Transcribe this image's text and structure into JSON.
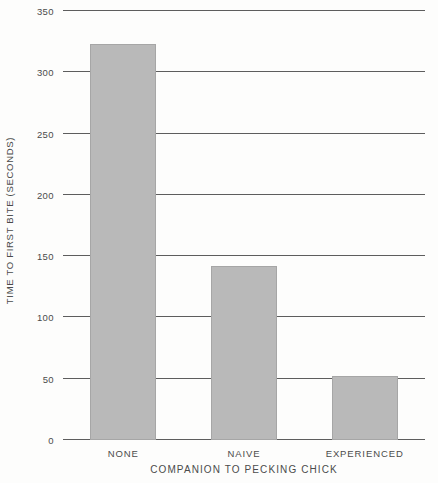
{
  "chart_data": {
    "type": "bar",
    "title": "",
    "xlabel": "COMPANION TO PECKING CHICK",
    "ylabel": "TIME TO FIRST BITE (SECONDS)",
    "categories": [
      "NONE",
      "NAIVE",
      "EXPERIENCED"
    ],
    "values": [
      323,
      142,
      52
    ],
    "ylim": [
      0,
      350
    ],
    "yticks": [
      0,
      50,
      100,
      150,
      200,
      250,
      300,
      350
    ],
    "ytick_labels": [
      "0",
      "50",
      "100",
      "150",
      "200",
      "250",
      "300",
      "350"
    ],
    "grid": true,
    "legend": false,
    "colors": {
      "bar_fill": "#b9b9b9",
      "bar_edge": "#a6a6a6",
      "gridline": "#5d5d5d",
      "text": "#4b4b4b",
      "background": "#fdfdfc"
    }
  }
}
